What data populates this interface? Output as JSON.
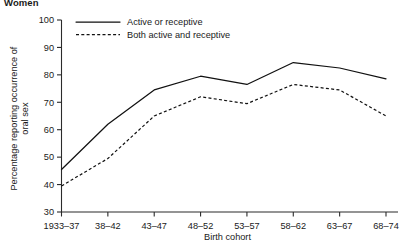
{
  "panel": {
    "title": "Women"
  },
  "axes": {
    "xlabel": "Birth cohort",
    "ylabel_line1": "Percentage reporting occurrence of",
    "ylabel_line2": "oral sex"
  },
  "legend": {
    "position": "top-left-inside",
    "items": [
      {
        "label": "Active or receptive",
        "style": "solid"
      },
      {
        "label": "Both active and receptive",
        "style": "dashed"
      }
    ]
  },
  "chart_data": {
    "type": "line",
    "title": "Women",
    "xlabel": "Birth cohort",
    "ylabel": "Percentage reporting occurrence of oral sex",
    "categories": [
      "1933–37",
      "38–42",
      "43–47",
      "48–52",
      "53–57",
      "58–62",
      "63–67",
      "68–74"
    ],
    "yticks": [
      30,
      40,
      50,
      60,
      70,
      80,
      90,
      100
    ],
    "ylim": [
      30,
      100
    ],
    "grid": false,
    "legend_position": "upper left",
    "series": [
      {
        "name": "Active or receptive",
        "style": "solid",
        "color": "#111111",
        "values": [
          45.5,
          62.0,
          74.5,
          79.5,
          76.5,
          84.5,
          82.5,
          78.5
        ]
      },
      {
        "name": "Both active and receptive",
        "style": "dashed",
        "color": "#111111",
        "values": [
          39.5,
          49.5,
          65.0,
          72.0,
          69.5,
          76.5,
          74.5,
          65.0
        ]
      }
    ]
  }
}
